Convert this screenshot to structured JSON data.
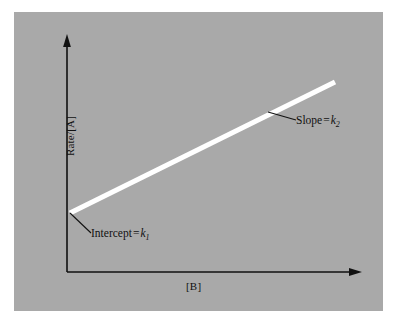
{
  "figure": {
    "background_color": "#ffffff",
    "panel_color": "#a9a9a9",
    "ink_color": "#111111",
    "line_color": "#ffffff"
  },
  "axes": {
    "y_label": "Rate/[A]",
    "x_label": "[B]",
    "y_arrow": "arrow-up",
    "x_arrow": "arrow-right"
  },
  "annotations": {
    "slope": {
      "text": "Slope",
      "equals": "=",
      "symbol": "k",
      "subscript": "2",
      "full": "Slope = k2"
    },
    "intercept": {
      "text": "Intercept",
      "equals": "=",
      "symbol": "k",
      "subscript": "1",
      "full": "Intercept = k1"
    }
  },
  "chart_data": {
    "type": "line",
    "title": "",
    "subtitle": "",
    "xlabel": "[B]",
    "ylabel": "Rate/[A]",
    "xlim": [
      0,
      1
    ],
    "ylim": [
      0,
      1
    ],
    "grid": false,
    "legend": null,
    "series": [
      {
        "name": "Rate/[A] vs [B]",
        "color": "#ffffff",
        "linewidth": 5,
        "x": [
          0.015,
          1.0
        ],
        "y": [
          0.295,
          0.935
        ],
        "points_pixel": [
          [
            70,
            213
          ],
          [
            335,
            82
          ]
        ]
      }
    ],
    "tick_labels": {
      "x": [],
      "y": []
    },
    "annotations": [
      {
        "label": "Slope = k2",
        "target_pixel": [
          268,
          112
        ],
        "text_pixel": [
          296,
          120
        ],
        "leader": true
      },
      {
        "label": "Intercept = k1",
        "target_pixel": [
          70,
          213
        ],
        "text_pixel": [
          91,
          233
        ],
        "leader": true
      }
    ]
  }
}
